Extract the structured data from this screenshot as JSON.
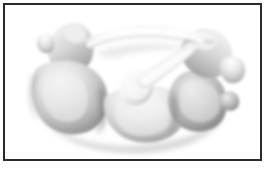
{
  "figure": {
    "kind": "3d-anatomical-render",
    "subject_label": "vertebra-3d-render",
    "caption": "",
    "background_color": "#ffffff",
    "frame_color": "#2b2b2b",
    "frame_width_px": 2,
    "frame_inset_px": 3,
    "canvas": {
      "width": 268,
      "height": 170
    },
    "palette": {
      "highlight": "#fdfdfd",
      "light_gray": "#e4e4e4",
      "mid_gray": "#bdbdbd",
      "shadow_gray": "#8d8d8d",
      "deep_shadow": "#5e5e5e",
      "outline": "#707070"
    },
    "parts": [
      {
        "name": "left-superior-process",
        "label": "Left superior articular process"
      },
      {
        "name": "left-vertebral-lobe",
        "label": "Left vertebral body lobe"
      },
      {
        "name": "lower-central-lobe",
        "label": "Lower central body lobe"
      },
      {
        "name": "neural-arch",
        "label": "Neural arch (lamina bridge)"
      },
      {
        "name": "central-pedicle",
        "label": "Central pedicle strut"
      },
      {
        "name": "right-superior-process",
        "label": "Right superior articular process"
      },
      {
        "name": "right-vertebral-lobe",
        "label": "Right vertebral body lobe"
      },
      {
        "name": "right-transverse-process",
        "label": "Right transverse process"
      }
    ]
  }
}
